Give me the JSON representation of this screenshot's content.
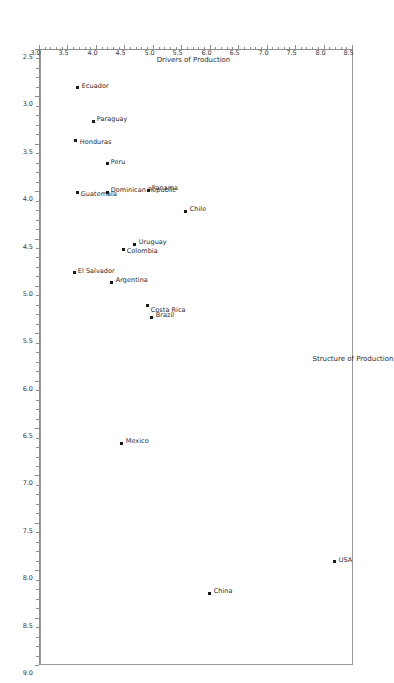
{
  "chart_data": {
    "type": "scatter",
    "title": "",
    "subtitle": "",
    "xlabel": "Structure of Production",
    "ylabel": "Drivers of Production",
    "xlim": [
      2.5,
      9.0
    ],
    "ylim": [
      3.0,
      8.5
    ],
    "x_ticks": [
      "2.5",
      "3.0",
      "3.5",
      "4.0",
      "4.5",
      "5.0",
      "5.5",
      "6.0",
      "6.5",
      "7.0",
      "7.5",
      "8.0",
      "8.5",
      "9.0"
    ],
    "y_ticks": [
      "3.0",
      "3.5",
      "4.0",
      "4.5",
      "5.0",
      "5.5",
      "6.0",
      "6.5",
      "7.0",
      "7.5",
      "8.0",
      "8.5"
    ],
    "x_tick_values": [
      2.5,
      3.0,
      3.5,
      4.0,
      4.5,
      5.0,
      5.5,
      6.0,
      6.5,
      7.0,
      7.5,
      8.0,
      8.5,
      9.0
    ],
    "y_tick_values": [
      3.0,
      3.5,
      4.0,
      4.5,
      5.0,
      5.5,
      6.0,
      6.5,
      7.0,
      7.5,
      8.0,
      8.5
    ],
    "grid": false,
    "legend": false,
    "rotation_deg": 90,
    "marker_color": "#1a1a1a",
    "frame_color": "#9a9a9a",
    "points": [
      {
        "label": "USA",
        "x": 7.9,
        "y": 8.2
      },
      {
        "label": "China",
        "x": 8.23,
        "y": 6.0
      },
      {
        "label": "Mexico",
        "x": 6.65,
        "y": 4.45
      },
      {
        "label": "Brazil",
        "x": 5.32,
        "y": 4.98
      },
      {
        "label": "Costa Rica",
        "x": 5.2,
        "y": 4.9
      },
      {
        "label": "Argentina",
        "x": 4.95,
        "y": 4.28
      },
      {
        "label": "Uruguay",
        "x": 4.55,
        "y": 4.68
      },
      {
        "label": "Colombia",
        "x": 4.6,
        "y": 4.48
      },
      {
        "label": "El Salvador",
        "x": 4.85,
        "y": 3.62
      },
      {
        "label": "Chile",
        "x": 4.2,
        "y": 5.58
      },
      {
        "label": "Panama",
        "x": 3.98,
        "y": 4.92
      },
      {
        "label": "Dominican Republic",
        "x": 4.0,
        "y": 4.2
      },
      {
        "label": "Guatemala",
        "x": 4.0,
        "y": 3.67
      },
      {
        "label": "Peru",
        "x": 3.7,
        "y": 4.2
      },
      {
        "label": "Paraguay",
        "x": 3.25,
        "y": 3.95
      },
      {
        "label": "Honduras",
        "x": 3.45,
        "y": 3.65
      },
      {
        "label": "Ecuador",
        "x": 2.9,
        "y": 3.68
      }
    ]
  }
}
